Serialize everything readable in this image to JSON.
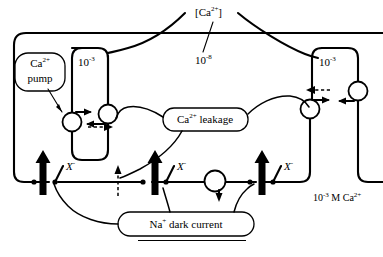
{
  "figure": {
    "title_label": "[Ca",
    "title_sup": "2+",
    "title_tail": "]",
    "outer_concentration": {
      "value": "10",
      "exponent": "-8"
    },
    "bottom_right_concentration": {
      "value": "10",
      "exponent": "-3",
      "unit": "M Ca",
      "ion_charge": "2+"
    },
    "left_compartment": {
      "name": "left-compartment",
      "concentration": "10",
      "exponent": "-3"
    },
    "right_compartment": {
      "name": "right-compartment",
      "concentration": "10",
      "exponent": "-3"
    },
    "pump_bubble": {
      "line1": "Ca",
      "line1_sup": "2+",
      "line2": "pump"
    },
    "leakage_bubble": {
      "text": "Ca",
      "sup": "2+",
      "tail": "leakage"
    },
    "dark_current_bubble": {
      "text": "Na",
      "sup": "+",
      "tail": "dark current"
    },
    "channel_labels": [
      {
        "symbol": "X",
        "charge": "-"
      },
      {
        "symbol": "X",
        "charge": "-"
      },
      {
        "symbol": "X",
        "charge": "-"
      }
    ]
  },
  "colors": {
    "ink": "#000000",
    "paper": "#ffffff"
  }
}
